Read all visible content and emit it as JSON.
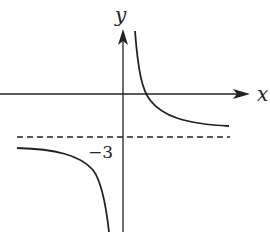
{
  "diagram": {
    "type": "function-graph",
    "axes": {
      "x_label": "x",
      "y_label": "y"
    },
    "asymptote": {
      "horizontal_value_label": "−3",
      "style": "dashed"
    },
    "branches": [
      {
        "name": "upper-right",
        "quadrant": "right of y-axis, above asymptote, crosses x-axis"
      },
      {
        "name": "lower-left",
        "quadrant": "left of y-axis, below asymptote"
      }
    ],
    "colors": {
      "stroke": "#222222",
      "background": "#ffffff"
    }
  }
}
